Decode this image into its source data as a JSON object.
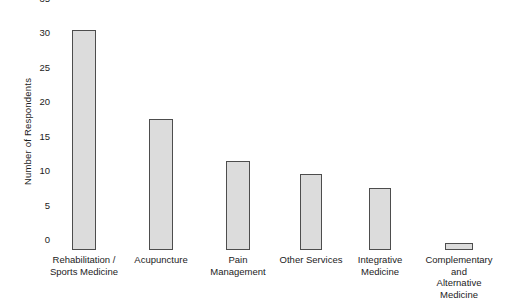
{
  "chart_data": {
    "type": "bar",
    "title": "",
    "xlabel": "",
    "ylabel": "Number of Respondents",
    "categories": [
      "Rehabilitation /\nSports Medicine",
      "Acupuncture",
      "Pain\nManagement",
      "Other Services",
      "Integrative\nMedicine",
      "Complementary and\nAlternative Medicine"
    ],
    "values": [
      32,
      19,
      13,
      11,
      9,
      1
    ],
    "ylim": [
      0,
      35
    ],
    "yticks": [
      0,
      5,
      10,
      15,
      20,
      25,
      30,
      35
    ],
    "ytick_labels": [
      "0",
      "5",
      "10",
      "15",
      "20",
      "25",
      "30",
      "35"
    ],
    "grid": false,
    "legend": null,
    "bar_fill_color": "#dcdcdc",
    "bar_border_color": "#4d4d4d",
    "background_color": "#ffffff"
  }
}
